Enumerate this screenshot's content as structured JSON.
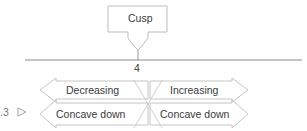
{
  "callout": {
    "label": "Cusp"
  },
  "number_line": {
    "tick_label": "4"
  },
  "left_interval": {
    "top_label": "Decreasing",
    "bottom_label": "Concave down"
  },
  "right_interval": {
    "top_label": "Increasing",
    "bottom_label": "Concave down"
  },
  "margin_note": {
    "label": ".3",
    "icon": "play-outline-icon"
  },
  "colors": {
    "stroke": "#b8b8b8",
    "axis": "#8a8a8a",
    "text": "#3a3a3a"
  }
}
